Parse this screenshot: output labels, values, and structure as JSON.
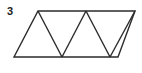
{
  "figure": {
    "label": "3",
    "background_color": "#ffffff",
    "stroke_color": "#2b2b2b",
    "stroke_width": 1.4,
    "fill": "none",
    "canvas": {
      "width": 142,
      "height": 73
    }
  },
  "chart_data": {
    "type": "diagram",
    "title": "3",
    "shape": "parallelogram-subdivided-into-triangles",
    "triangle_count": 4,
    "vertices": {
      "top": [
        {
          "name": "T1",
          "x": 38,
          "y": 11
        },
        {
          "name": "T2",
          "x": 86,
          "y": 11
        },
        {
          "name": "T3",
          "x": 135,
          "y": 11
        }
      ],
      "bottom": [
        {
          "name": "B1",
          "x": 14,
          "y": 57
        },
        {
          "name": "B2",
          "x": 62,
          "y": 57
        },
        {
          "name": "B3",
          "x": 110,
          "y": 57
        }
      ],
      "bottom_right_corner": {
        "name": "B4",
        "x": 118,
        "y": 57
      }
    },
    "outline_path": "M 38 11 L 135 11 L 118 57 L 14 57 Z",
    "internal_segments": [
      {
        "name": "diagonal-1",
        "from": [
          38,
          11
        ],
        "to": [
          62,
          57
        ]
      },
      {
        "name": "diagonal-2",
        "from": [
          62,
          57
        ],
        "to": [
          86,
          11
        ]
      },
      {
        "name": "diagonal-3",
        "from": [
          86,
          11
        ],
        "to": [
          110,
          57
        ]
      },
      {
        "name": "diagonal-4",
        "from": [
          110,
          57
        ],
        "to": [
          135,
          11
        ]
      }
    ],
    "triangles": [
      {
        "name": "triangle-1-up",
        "orientation": "up",
        "points": "14,57 38,11 62,57"
      },
      {
        "name": "triangle-2-down",
        "orientation": "down",
        "points": "38,11 86,11 62,57"
      },
      {
        "name": "triangle-3-up",
        "orientation": "up",
        "points": "62,57 86,11 110,57"
      },
      {
        "name": "triangle-4-down",
        "orientation": "down",
        "points": "86,11 135,11 110,57"
      }
    ],
    "xlabel": "",
    "ylabel": "",
    "grid": false,
    "legend": false
  }
}
